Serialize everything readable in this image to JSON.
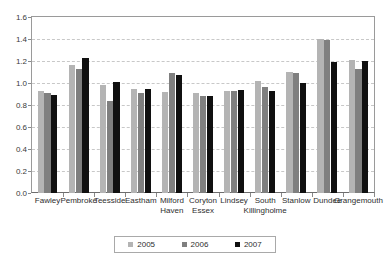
{
  "chart_data": {
    "type": "bar",
    "title": "",
    "subtitle": "",
    "xlabel": "",
    "ylabel": "",
    "ylim": [
      0,
      1.6
    ],
    "ytick_step": 0.2,
    "yticks": [
      "0.0",
      "0.2",
      "0.4",
      "0.6",
      "0.8",
      "1.0",
      "1.2",
      "1.4",
      "1.6"
    ],
    "grid": true,
    "legend_position": "bottom",
    "categories": [
      "Fawley",
      "Pembroke",
      "Teesside",
      "Eastham",
      "Milford Haven",
      "Coryton Essex",
      "Lindsey",
      "South Killingholme",
      "Stanlow",
      "Dundee",
      "Grangemouth"
    ],
    "category_lines": [
      [
        "Fawley",
        ""
      ],
      [
        "Pembroke",
        ""
      ],
      [
        "Teesside",
        ""
      ],
      [
        "Eastham",
        ""
      ],
      [
        "Milford",
        "Haven"
      ],
      [
        "Coryton",
        "Essex"
      ],
      [
        "Lindsey",
        ""
      ],
      [
        "South",
        "Killingholme"
      ],
      [
        "Stanlow",
        ""
      ],
      [
        "Dundee",
        ""
      ],
      [
        "Grangemouth",
        ""
      ]
    ],
    "series": [
      {
        "name": "2005",
        "color": "#b4b4b4",
        "values": [
          0.93,
          1.16,
          0.98,
          0.95,
          0.92,
          0.91,
          0.93,
          1.02,
          1.1,
          1.4,
          1.21
        ]
      },
      {
        "name": "2006",
        "color": "#7f7f7f",
        "values": [
          0.91,
          1.13,
          0.84,
          0.91,
          1.09,
          0.88,
          0.93,
          0.96,
          1.09,
          1.39,
          1.13
        ]
      },
      {
        "name": "2007",
        "color": "#101010",
        "values": [
          0.89,
          1.23,
          1.01,
          0.95,
          1.07,
          0.88,
          0.94,
          0.93,
          1.0,
          1.19,
          1.2
        ]
      }
    ]
  },
  "legend": {
    "items": [
      {
        "label": "2005",
        "color": "#b4b4b4"
      },
      {
        "label": "2006",
        "color": "#7f7f7f"
      },
      {
        "label": "2007",
        "color": "#101010"
      }
    ]
  },
  "colors": {
    "axis": "#6d6d6d",
    "grid": "#c8c8c8",
    "text": "#2e2e2e",
    "background": "#ffffff"
  }
}
